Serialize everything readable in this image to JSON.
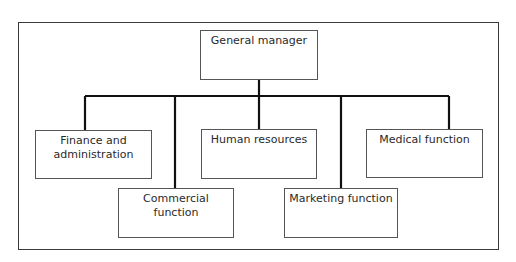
{
  "diagram": {
    "type": "org-chart",
    "root": {
      "label": "General manager"
    },
    "children": [
      {
        "label": "Finance and administration",
        "line1": "Finance and",
        "line2": "administration",
        "row": "upper"
      },
      {
        "label": "Commercial function",
        "row": "lower"
      },
      {
        "label": "Human resources",
        "row": "upper"
      },
      {
        "label": "Marketing function",
        "row": "lower"
      },
      {
        "label": "Medical function",
        "row": "upper"
      }
    ],
    "colors": {
      "line": "#111111",
      "box_border": "#555555",
      "frame_border": "#3a3a3a",
      "text": "#2a2a2a"
    }
  }
}
